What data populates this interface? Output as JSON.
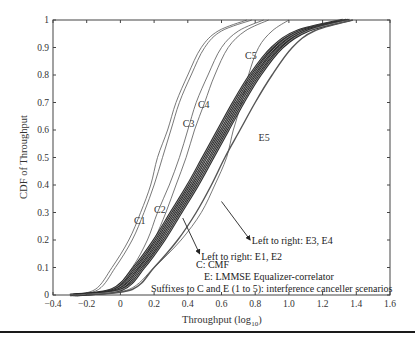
{
  "chart_data": {
    "type": "line",
    "title": "",
    "xlabel": "Throughput (log10)",
    "xlabel_main": "Throughput (log",
    "xlabel_sub": "10",
    "xlabel_close": ")",
    "ylabel": "CDF of Throughput",
    "xlim": [
      -0.4,
      1.6
    ],
    "ylim": [
      0,
      1
    ],
    "xticks": [
      -0.4,
      -0.2,
      0,
      0.2,
      0.4,
      0.6,
      0.8,
      1.0,
      1.2,
      1.4,
      1.6
    ],
    "xtick_labels": [
      "−0.4",
      "−0.2",
      "0",
      "0.2",
      "0.4",
      "0.6",
      "0.8",
      "1.0",
      "1.2",
      "1.4",
      "1.6"
    ],
    "yticks": [
      0,
      0.1,
      0.2,
      0.3,
      0.4,
      0.5,
      0.6,
      0.7,
      0.8,
      0.9,
      1
    ],
    "ytick_labels": [
      "0",
      "0.1",
      "0.2",
      "0.3",
      "0.4",
      "0.5",
      "0.6",
      "0.7",
      "0.8",
      "0.9",
      "1"
    ],
    "grid": false,
    "series": [
      {
        "name": "C1",
        "style": "thin",
        "x": [
          -0.3,
          -0.15,
          -0.05,
          0.05,
          0.12,
          0.18,
          0.22,
          0.28,
          0.33,
          0.4,
          0.48,
          0.58,
          0.75
        ],
        "y": [
          0,
          0.02,
          0.1,
          0.2,
          0.3,
          0.4,
          0.5,
          0.6,
          0.7,
          0.8,
          0.9,
          0.96,
          1.0
        ]
      },
      {
        "name": "C2",
        "style": "thin",
        "x": [
          -0.28,
          -0.13,
          -0.03,
          0.07,
          0.14,
          0.2,
          0.25,
          0.3,
          0.35,
          0.42,
          0.5,
          0.6,
          0.78
        ],
        "y": [
          0,
          0.02,
          0.1,
          0.2,
          0.3,
          0.4,
          0.5,
          0.6,
          0.7,
          0.8,
          0.9,
          0.96,
          1.0
        ]
      },
      {
        "name": "C3",
        "style": "thin",
        "x": [
          -0.25,
          -0.05,
          0.07,
          0.16,
          0.22,
          0.29,
          0.35,
          0.4,
          0.45,
          0.52,
          0.6,
          0.7,
          0.85
        ],
        "y": [
          0,
          0.02,
          0.1,
          0.2,
          0.3,
          0.4,
          0.5,
          0.6,
          0.7,
          0.8,
          0.9,
          0.96,
          1.0
        ]
      },
      {
        "name": "C4",
        "style": "thin",
        "x": [
          -0.22,
          0.0,
          0.11,
          0.2,
          0.27,
          0.33,
          0.39,
          0.44,
          0.5,
          0.56,
          0.64,
          0.74,
          0.88
        ],
        "y": [
          0,
          0.02,
          0.1,
          0.2,
          0.3,
          0.4,
          0.5,
          0.6,
          0.7,
          0.8,
          0.9,
          0.96,
          1.0
        ]
      },
      {
        "name": "C5",
        "style": "thin",
        "x": [
          -0.2,
          0.05,
          0.2,
          0.36,
          0.48,
          0.56,
          0.63,
          0.67,
          0.72,
          0.76,
          0.82,
          0.9,
          1.0
        ],
        "y": [
          0,
          0.02,
          0.1,
          0.2,
          0.3,
          0.4,
          0.5,
          0.6,
          0.7,
          0.8,
          0.9,
          0.96,
          1.0
        ]
      },
      {
        "name": "E1",
        "style": "thick",
        "x": [
          -0.3,
          -0.05,
          0.08,
          0.2,
          0.3,
          0.4,
          0.49,
          0.58,
          0.67,
          0.77,
          0.9,
          1.05,
          1.32
        ],
        "y": [
          0,
          0.02,
          0.1,
          0.2,
          0.3,
          0.4,
          0.5,
          0.6,
          0.7,
          0.8,
          0.9,
          0.96,
          1.0
        ]
      },
      {
        "name": "E2",
        "style": "thick",
        "x": [
          -0.28,
          -0.03,
          0.1,
          0.22,
          0.32,
          0.42,
          0.51,
          0.6,
          0.69,
          0.79,
          0.92,
          1.07,
          1.34
        ],
        "y": [
          0,
          0.02,
          0.1,
          0.2,
          0.3,
          0.4,
          0.5,
          0.6,
          0.7,
          0.8,
          0.9,
          0.96,
          1.0
        ]
      },
      {
        "name": "E3",
        "style": "thick",
        "x": [
          -0.27,
          -0.01,
          0.12,
          0.24,
          0.34,
          0.44,
          0.53,
          0.62,
          0.71,
          0.81,
          0.94,
          1.09,
          1.35
        ],
        "y": [
          0,
          0.02,
          0.1,
          0.2,
          0.3,
          0.4,
          0.5,
          0.6,
          0.7,
          0.8,
          0.9,
          0.96,
          1.0
        ]
      },
      {
        "name": "E4",
        "style": "thick",
        "x": [
          -0.26,
          0.01,
          0.14,
          0.26,
          0.36,
          0.46,
          0.55,
          0.64,
          0.73,
          0.83,
          0.96,
          1.11,
          1.36
        ],
        "y": [
          0,
          0.02,
          0.1,
          0.2,
          0.3,
          0.4,
          0.5,
          0.6,
          0.7,
          0.8,
          0.9,
          0.96,
          1.0
        ]
      },
      {
        "name": "E5",
        "style": "medium",
        "x": [
          -0.2,
          0.07,
          0.2,
          0.34,
          0.45,
          0.54,
          0.62,
          0.71,
          0.8,
          0.9,
          1.02,
          1.15,
          1.38
        ],
        "y": [
          0,
          0.02,
          0.1,
          0.2,
          0.3,
          0.4,
          0.5,
          0.6,
          0.7,
          0.8,
          0.9,
          0.96,
          1.0
        ]
      }
    ],
    "curve_labels": [
      {
        "text": "C1",
        "x": 0.08,
        "y": 0.26
      },
      {
        "text": "C2",
        "x": 0.2,
        "y": 0.3
      },
      {
        "text": "C3",
        "x": 0.37,
        "y": 0.61
      },
      {
        "text": "C4",
        "x": 0.46,
        "y": 0.68
      },
      {
        "text": "C5",
        "x": 0.74,
        "y": 0.86
      },
      {
        "text": "E5",
        "x": 0.82,
        "y": 0.56
      }
    ],
    "annotations": [
      {
        "text": "Left to right: E3, E4",
        "x": 0.78,
        "y": 0.195,
        "arrow_from": [
          0.6,
          0.34
        ],
        "arrow_to": [
          0.77,
          0.2
        ]
      },
      {
        "text": "Left to right: E1, E2",
        "x": 0.48,
        "y": 0.14,
        "arrow_from": [
          0.37,
          0.28
        ],
        "arrow_to": [
          0.47,
          0.15
        ]
      }
    ],
    "legend_box": {
      "lines": [
        "C: CMF",
        "E: LMMSE Equalizer-correlator",
        "Suffixes to C and E (1 to 5): interference canceller scenarios"
      ]
    }
  }
}
